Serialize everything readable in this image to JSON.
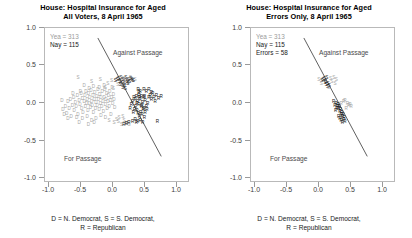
{
  "figure": {
    "caption_line1": "D = N. Democrat, S = S. Democrat,",
    "caption_line2": "R = Republican",
    "colors": {
      "yea": "#a6a6a6",
      "nay": "#141414",
      "cutline": "#2b2b2b",
      "axis": "#b9b9b9"
    }
  },
  "panels": [
    {
      "id": "all-voters",
      "title_line1": "House: Hospital Insurance for Aged",
      "title_line2": "All Voters, 8 April 1965",
      "legend": {
        "yea": "Yea = 313",
        "nay": "Nay = 115",
        "errors": null
      },
      "annotations": {
        "against": "Against Passage",
        "for": "For Passage"
      }
    },
    {
      "id": "errors-only",
      "title_line1": "House: Hospital Insurance for Aged",
      "title_line2": "Errors Only, 8 April 1965",
      "legend": {
        "yea": "Yea = 313",
        "nay": "Nay = 115",
        "errors": "Errors = 58"
      },
      "annotations": {
        "against": "Against Passage",
        "for": "For Passage"
      }
    }
  ],
  "chart_data": {
    "type": "scatter",
    "xlabel": "",
    "ylabel": "",
    "xlim": [
      -1.15,
      1.15
    ],
    "ylim": [
      -1.15,
      1.15
    ],
    "xticks": [
      -1.0,
      -0.5,
      0.0,
      0.5,
      1.0
    ],
    "yticks": [
      -1.0,
      -0.5,
      0.0,
      0.5,
      1.0
    ],
    "xticklabels": [
      "-1.0",
      "-0.5",
      "0.0",
      "0.5",
      "1.0"
    ],
    "yticklabels": [
      "-1.0",
      "-0.5",
      "0.0",
      "0.5",
      "1.0"
    ],
    "grid": false,
    "legend_position": "upper-left-text",
    "vote_counts": {
      "yea": 313,
      "nay": 115,
      "errors": 58
    },
    "marker_glyphs": {
      "D": "N. Democrat",
      "S": "S. Democrat",
      "R": "Republican"
    },
    "marker_colors": {
      "yea": "#a6a6a6",
      "nay": "#141414"
    },
    "cutting_line": {
      "panel_all": {
        "x1": -0.3,
        "y1": 1.0,
        "x2": 0.72,
        "y2": -0.78
      },
      "panel_errors": {
        "x1": -0.3,
        "y1": 1.0,
        "x2": 0.72,
        "y2": -0.78
      }
    },
    "annotations": [
      {
        "text": "Against Passage",
        "x": 0.32,
        "y": 0.78
      },
      {
        "text": "For Passage",
        "x": -0.52,
        "y": -0.58
      }
    ],
    "series": [
      {
        "name": "Yea (N. Democrat)",
        "glyph": "D",
        "color": "#a6a6a6",
        "panel": "all",
        "points": [
          [
            -0.86,
            -0.1
          ],
          [
            -0.82,
            -0.05
          ],
          [
            -0.8,
            -0.16
          ],
          [
            -0.78,
            0.02
          ],
          [
            -0.76,
            -0.08
          ],
          [
            -0.74,
            0.06
          ],
          [
            -0.73,
            -0.2
          ],
          [
            -0.71,
            -0.03
          ],
          [
            -0.69,
            0.09
          ],
          [
            -0.68,
            -0.12
          ],
          [
            -0.66,
            0.01
          ],
          [
            -0.65,
            -0.06
          ],
          [
            -0.63,
            0.12
          ],
          [
            -0.62,
            -0.18
          ],
          [
            -0.6,
            0.04
          ],
          [
            -0.59,
            -0.02
          ],
          [
            -0.57,
            0.15
          ],
          [
            -0.56,
            -0.09
          ],
          [
            -0.55,
            0.07
          ],
          [
            -0.54,
            -0.14
          ],
          [
            -0.52,
            0.02
          ],
          [
            -0.51,
            0.11
          ],
          [
            -0.5,
            -0.05
          ],
          [
            -0.49,
            0.18
          ],
          [
            -0.48,
            -0.01
          ],
          [
            -0.47,
            0.05
          ],
          [
            -0.46,
            -0.11
          ],
          [
            -0.45,
            0.14
          ],
          [
            -0.44,
            0.0
          ],
          [
            -0.43,
            0.08
          ],
          [
            -0.42,
            -0.07
          ],
          [
            -0.41,
            0.19
          ],
          [
            -0.4,
            0.03
          ],
          [
            -0.39,
            -0.03
          ],
          [
            -0.38,
            0.12
          ],
          [
            -0.37,
            -0.15
          ],
          [
            -0.36,
            0.06
          ],
          [
            -0.35,
            0.16
          ],
          [
            -0.34,
            -0.08
          ],
          [
            -0.33,
            0.01
          ],
          [
            -0.32,
            0.1
          ],
          [
            -0.31,
            -0.04
          ],
          [
            -0.3,
            0.2
          ],
          [
            -0.29,
            0.05
          ],
          [
            -0.28,
            -0.1
          ],
          [
            -0.27,
            0.13
          ],
          [
            -0.26,
            0.0
          ],
          [
            -0.25,
            0.08
          ],
          [
            -0.24,
            -0.06
          ],
          [
            -0.23,
            0.17
          ],
          [
            -0.22,
            0.03
          ],
          [
            -0.21,
            -0.13
          ],
          [
            -0.2,
            0.09
          ],
          [
            -0.19,
            0.21
          ],
          [
            -0.18,
            -0.02
          ],
          [
            -0.17,
            0.06
          ],
          [
            -0.16,
            0.14
          ],
          [
            -0.15,
            -0.09
          ],
          [
            -0.14,
            0.02
          ],
          [
            -0.13,
            0.11
          ],
          [
            -0.12,
            -0.05
          ],
          [
            -0.11,
            0.18
          ],
          [
            -0.1,
            0.04
          ],
          [
            -0.09,
            -0.17
          ],
          [
            -0.08,
            0.08
          ],
          [
            -0.07,
            0.23
          ],
          [
            -0.06,
            -0.01
          ],
          [
            -0.05,
            0.13
          ],
          [
            -0.04,
            0.05
          ],
          [
            -0.03,
            -0.07
          ],
          [
            -0.44,
            0.22
          ],
          [
            -0.58,
            0.18
          ],
          [
            -0.7,
            0.14
          ],
          [
            -0.37,
            0.25
          ],
          [
            -0.28,
            0.24
          ],
          [
            -0.64,
            -0.22
          ],
          [
            -0.55,
            -0.24
          ],
          [
            -0.47,
            -0.21
          ],
          [
            -0.4,
            -0.26
          ],
          [
            -0.33,
            -0.23
          ],
          [
            -0.25,
            -0.19
          ],
          [
            -0.18,
            -0.22
          ],
          [
            -0.6,
            -0.3
          ],
          [
            -0.45,
            -0.32
          ],
          [
            -0.36,
            -0.29
          ],
          [
            -0.78,
            -0.24
          ],
          [
            -0.84,
            -0.18
          ],
          [
            -0.88,
            0.04
          ],
          [
            -0.52,
            0.26
          ],
          [
            -0.2,
            0.27
          ]
        ]
      },
      {
        "name": "Yea (S. Democrat)",
        "glyph": "S",
        "color": "#a6a6a6",
        "panel": "all",
        "points": [
          [
            -0.62,
            0.38
          ],
          [
            -0.4,
            0.33
          ],
          [
            -0.26,
            0.36
          ],
          [
            -0.14,
            0.3
          ],
          [
            -0.08,
            0.34
          ],
          [
            0.02,
            0.28
          ],
          [
            0.06,
            0.33
          ],
          [
            0.1,
            0.37
          ],
          [
            -0.18,
            0.24
          ],
          [
            -0.05,
            0.22
          ],
          [
            0.14,
            0.35
          ],
          [
            0.18,
            0.31
          ],
          [
            0.22,
            0.38
          ],
          [
            0.26,
            0.34
          ],
          [
            0.3,
            0.36
          ],
          [
            -0.12,
            -0.27
          ],
          [
            -0.04,
            -0.3
          ],
          [
            0.03,
            -0.28
          ],
          [
            0.08,
            -0.32
          ],
          [
            0.12,
            -0.26
          ],
          [
            0.16,
            -0.31
          ],
          [
            0.04,
            -0.22
          ],
          [
            0.1,
            -0.2
          ],
          [
            0.2,
            -0.33
          ],
          [
            0.0,
            -0.25
          ]
        ]
      },
      {
        "name": "Nay (S. Democrat)",
        "glyph": "S",
        "color": "#141414",
        "panel": "all",
        "points": [
          [
            0.03,
            0.37
          ],
          [
            0.07,
            0.38
          ],
          [
            0.11,
            0.36
          ],
          [
            0.15,
            0.39
          ],
          [
            0.19,
            0.35
          ],
          [
            0.23,
            0.37
          ],
          [
            0.27,
            0.34
          ],
          [
            0.05,
            0.33
          ],
          [
            0.09,
            0.31
          ],
          [
            0.13,
            0.3
          ],
          [
            0.01,
            0.35
          ],
          [
            0.17,
            0.32
          ],
          [
            0.21,
            0.33
          ],
          [
            0.25,
            0.36
          ],
          [
            -0.02,
            0.34
          ],
          [
            0.06,
            0.28
          ],
          [
            0.12,
            0.26
          ],
          [
            0.18,
            0.29
          ],
          [
            0.1,
            0.24
          ],
          [
            0.14,
            0.22
          ]
        ]
      },
      {
        "name": "Nay (Republican)",
        "glyph": "R",
        "color": "#141414",
        "panel": "all",
        "points": [
          [
            0.3,
            0.06
          ],
          [
            0.34,
            0.02
          ],
          [
            0.36,
            -0.02
          ],
          [
            0.38,
            0.05
          ],
          [
            0.4,
            -0.06
          ],
          [
            0.42,
            0.01
          ],
          [
            0.44,
            -0.09
          ],
          [
            0.46,
            0.04
          ],
          [
            0.33,
            -0.12
          ],
          [
            0.35,
            -0.16
          ],
          [
            0.37,
            -0.2
          ],
          [
            0.39,
            -0.14
          ],
          [
            0.41,
            -0.18
          ],
          [
            0.43,
            -0.1
          ],
          [
            0.45,
            -0.22
          ],
          [
            0.31,
            -0.05
          ],
          [
            0.29,
            -0.1
          ],
          [
            0.27,
            -0.15
          ],
          [
            0.32,
            0.1
          ],
          [
            0.36,
            0.12
          ],
          [
            0.28,
            0.08
          ],
          [
            0.26,
            0.03
          ],
          [
            0.24,
            -0.02
          ],
          [
            0.22,
            -0.08
          ],
          [
            0.3,
            -0.25
          ],
          [
            0.34,
            -0.28
          ],
          [
            0.38,
            -0.26
          ],
          [
            0.42,
            -0.3
          ],
          [
            0.46,
            -0.14
          ],
          [
            0.48,
            -0.05
          ],
          [
            0.5,
            0.0
          ],
          [
            0.52,
            0.08
          ],
          [
            0.56,
            0.05
          ],
          [
            0.6,
            0.09
          ],
          [
            0.64,
            0.11
          ],
          [
            0.68,
            0.07
          ],
          [
            0.72,
            0.1
          ],
          [
            0.58,
            0.14
          ],
          [
            0.54,
            0.12
          ],
          [
            0.62,
            0.03
          ],
          [
            0.44,
            0.08
          ],
          [
            0.4,
            0.1
          ],
          [
            0.36,
            0.16
          ],
          [
            0.32,
            -0.3
          ],
          [
            0.26,
            -0.28
          ],
          [
            0.2,
            -0.3
          ],
          [
            0.16,
            -0.31
          ],
          [
            0.12,
            -0.33
          ],
          [
            0.66,
            -0.28
          ],
          [
            0.48,
            0.18
          ],
          [
            0.52,
            0.2
          ],
          [
            0.56,
            0.16
          ],
          [
            0.44,
            0.2
          ],
          [
            0.38,
            0.18
          ],
          [
            0.35,
            0.2
          ],
          [
            0.33,
            -0.01
          ],
          [
            0.37,
            0.08
          ],
          [
            0.41,
            -0.04
          ],
          [
            0.45,
            0.1
          ],
          [
            0.49,
            -0.1
          ]
        ]
      },
      {
        "name": "Errors (S. Democrat)",
        "glyph": "S",
        "color": "#141414",
        "panel": "errors",
        "points": [
          [
            0.03,
            0.37
          ],
          [
            0.07,
            0.38
          ],
          [
            0.05,
            0.33
          ],
          [
            0.09,
            0.3
          ],
          [
            0.01,
            0.36
          ],
          [
            0.06,
            0.28
          ],
          [
            0.11,
            0.27
          ],
          [
            -0.01,
            0.34
          ],
          [
            0.08,
            0.25
          ],
          [
            0.04,
            0.31
          ]
        ]
      },
      {
        "name": "Errors (S. Democrat, yea-side)",
        "glyph": "S",
        "color": "#a6a6a6",
        "panel": "errors",
        "points": [
          [
            0.13,
            0.37
          ],
          [
            0.18,
            0.38
          ],
          [
            0.22,
            0.35
          ],
          [
            0.15,
            0.33
          ],
          [
            0.2,
            0.3
          ],
          [
            -0.06,
            0.36
          ],
          [
            -0.02,
            0.3
          ],
          [
            0.1,
            0.24
          ]
        ]
      },
      {
        "name": "Errors (Republican)",
        "glyph": "R",
        "color": "#141414",
        "panel": "errors",
        "points": [
          [
            0.18,
            0.02
          ],
          [
            0.22,
            -0.01
          ],
          [
            0.24,
            -0.05
          ],
          [
            0.26,
            -0.09
          ],
          [
            0.28,
            -0.13
          ],
          [
            0.3,
            -0.17
          ],
          [
            0.32,
            -0.21
          ],
          [
            0.34,
            -0.25
          ],
          [
            0.2,
            -0.04
          ],
          [
            0.25,
            -0.02
          ],
          [
            0.27,
            -0.06
          ],
          [
            0.29,
            -0.1
          ],
          [
            0.31,
            -0.14
          ],
          [
            0.33,
            -0.18
          ],
          [
            0.35,
            -0.22
          ],
          [
            0.23,
            -0.08
          ],
          [
            0.21,
            -0.12
          ],
          [
            0.26,
            -0.2
          ],
          [
            0.3,
            -0.26
          ],
          [
            0.28,
            -0.24
          ],
          [
            0.36,
            -0.28
          ],
          [
            0.32,
            -0.3
          ]
        ]
      },
      {
        "name": "Errors (Republican, yea-side)",
        "glyph": "R",
        "color": "#a6a6a6",
        "panel": "errors",
        "points": [
          [
            0.36,
            0.04
          ],
          [
            0.4,
            0.0
          ],
          [
            0.42,
            -0.04
          ],
          [
            0.38,
            -0.08
          ],
          [
            0.34,
            0.02
          ],
          [
            0.44,
            -0.02
          ],
          [
            0.3,
            0.0
          ],
          [
            0.46,
            -0.06
          ]
        ]
      }
    ]
  }
}
